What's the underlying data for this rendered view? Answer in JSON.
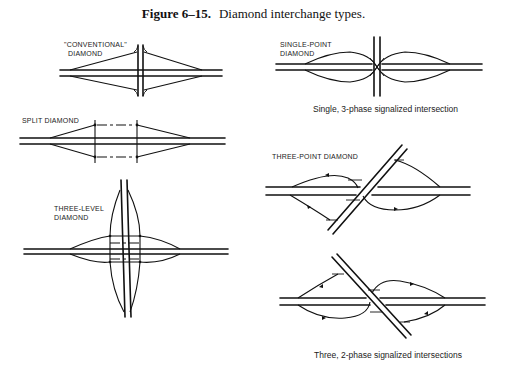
{
  "figure": {
    "number": "Figure 6–15.",
    "title": "Diamond interchange types."
  },
  "panels": [
    {
      "id": "conventional",
      "label_line1": "\"CONVENTIONAL\"",
      "label_line2": "DIAMOND"
    },
    {
      "id": "split",
      "label_line1": "SPLIT DIAMOND",
      "label_line2": ""
    },
    {
      "id": "three-level",
      "label_line1": "THREE-LEVEL",
      "label_line2": "DIAMOND"
    },
    {
      "id": "single-point",
      "label_line1": "SINGLE-POINT",
      "label_line2": "DIAMOND",
      "caption": "Single, 3-phase signalized intersection"
    },
    {
      "id": "three-point",
      "label_line1": "THREE-POINT DIAMOND",
      "label_line2": "",
      "caption": "Three, 2-phase signalized intersections"
    }
  ],
  "colors": {
    "ink": "#111111",
    "background": "#ffffff"
  }
}
